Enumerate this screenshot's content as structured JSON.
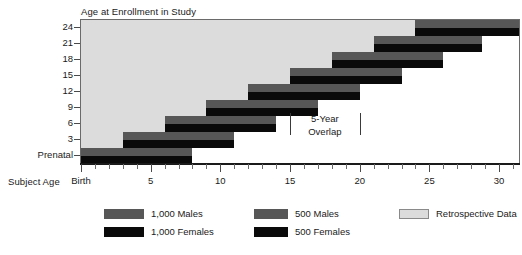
{
  "figure": {
    "y_axis_title": "Age at Enrollment in Study",
    "x_axis_title": "Subject Age"
  },
  "annotation": {
    "line1": "5-Year",
    "line2": "Overlap",
    "start_age": 15,
    "end_age": 20
  },
  "legend": {
    "items": [
      {
        "label": "1,000 Males",
        "swatch": "male-swatch",
        "color": "#575757"
      },
      {
        "label": "1,000 Females",
        "swatch": "female-swatch",
        "color": "#0a0a0a"
      },
      {
        "label": "500 Males",
        "swatch": "male-swatch",
        "color": "#575757"
      },
      {
        "label": "500 Females",
        "swatch": "female-swatch",
        "color": "#0a0a0a"
      },
      {
        "label": "Retrospective Data",
        "swatch": "retro-swatch",
        "color": "#dcdcdc"
      }
    ]
  },
  "chart_data": {
    "type": "bar",
    "title": "",
    "xlabel": "Subject Age",
    "ylabel": "Age at Enrollment in Study",
    "xlim": [
      0,
      31.5
    ],
    "grid": false,
    "legend_position": "bottom",
    "x_ticks_major": [
      {
        "value": 0,
        "label": "Birth"
      },
      {
        "value": 5,
        "label": "5"
      },
      {
        "value": 10,
        "label": "10"
      },
      {
        "value": 15,
        "label": "15"
      },
      {
        "value": 20,
        "label": "20"
      },
      {
        "value": 25,
        "label": "25"
      },
      {
        "value": 30,
        "label": "30"
      }
    ],
    "x_ticks_minor": [
      1,
      2,
      3,
      4,
      6,
      7,
      8,
      9,
      11,
      12,
      13,
      14,
      16,
      17,
      18,
      19,
      21,
      22,
      23,
      24,
      26,
      27,
      28,
      29,
      31
    ],
    "y_ticks": [
      {
        "label": "24",
        "cohort_index": 8
      },
      {
        "label": "21",
        "cohort_index": 7
      },
      {
        "label": "18",
        "cohort_index": 6
      },
      {
        "label": "15",
        "cohort_index": 5
      },
      {
        "label": "12",
        "cohort_index": 4
      },
      {
        "label": "9",
        "cohort_index": 3
      },
      {
        "label": "6",
        "cohort_index": 2
      },
      {
        "label": "3",
        "cohort_index": 1
      },
      {
        "label": "Prenatal",
        "cohort_index": 0
      }
    ],
    "cohorts": [
      {
        "enrollment_age": "Prenatal",
        "start": 0,
        "end": 8.0,
        "retro_start": 0
      },
      {
        "enrollment_age": "3",
        "start": 3,
        "end": 11.0,
        "retro_start": 0
      },
      {
        "enrollment_age": "6",
        "start": 6,
        "end": 14.0,
        "retro_start": 0
      },
      {
        "enrollment_age": "9",
        "start": 9,
        "end": 17.0,
        "retro_start": 0
      },
      {
        "enrollment_age": "12",
        "start": 12,
        "end": 20.0,
        "retro_start": 0
      },
      {
        "enrollment_age": "15",
        "start": 15,
        "end": 23.0,
        "retro_start": 0
      },
      {
        "enrollment_age": "18",
        "start": 18,
        "end": 26.0,
        "retro_start": 0
      },
      {
        "enrollment_age": "21",
        "start": 21,
        "end": 28.75,
        "retro_start": 0
      },
      {
        "enrollment_age": "24",
        "start": 24,
        "end": 31.5,
        "retro_start": 0
      }
    ],
    "series": [
      {
        "name": "Males",
        "color": "#575757",
        "position": "upper-half"
      },
      {
        "name": "Females",
        "color": "#0a0a0a",
        "position": "lower-half"
      }
    ]
  }
}
